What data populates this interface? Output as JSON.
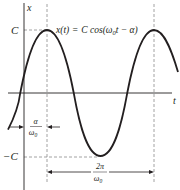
{
  "diagram": {
    "type": "sinusoid",
    "axes": {
      "vertical_label": "x",
      "horizontal_label": "t"
    },
    "equation": {
      "lhs": "x(t)",
      "eq": "=",
      "rhs_prefix": "C cos(",
      "omega": "ω",
      "omega_sub": "0",
      "rhs_suffix": "t − α)"
    },
    "levels": {
      "max_label": "C",
      "min_label": "−C"
    },
    "phase_annotation": {
      "numerator": "α",
      "denominator": "ω",
      "denominator_sub": "0"
    },
    "period_annotation": {
      "numerator": "2π",
      "denominator": "ω",
      "denominator_sub": "0"
    },
    "colors": {
      "curve": "#231f20",
      "axis": "#231f20",
      "dashed": "#8a8a8a"
    }
  }
}
